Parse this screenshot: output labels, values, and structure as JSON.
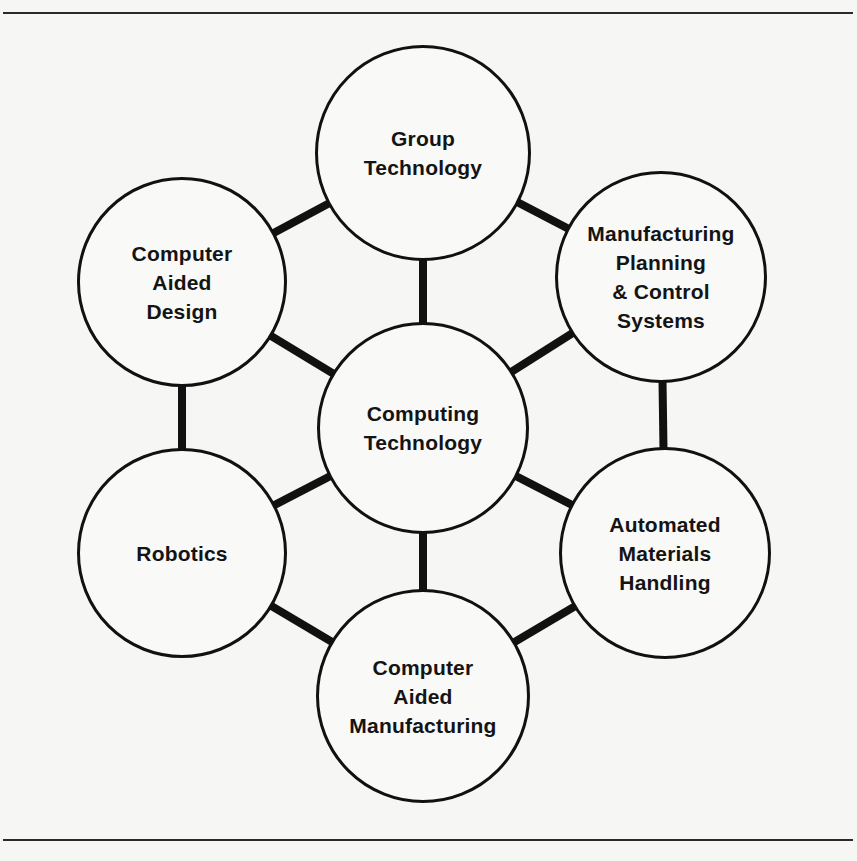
{
  "diagram": {
    "title": "",
    "colors": {
      "stroke": "#111111",
      "fill": "#f9f9f7",
      "background": "#f6f6f4",
      "text": "#141414"
    },
    "rules": [
      {
        "y": 12
      },
      {
        "y": 839
      }
    ],
    "nodes": [
      {
        "id": "group-technology",
        "label": "Group\nTechnology",
        "cx": 423,
        "cy": 153,
        "r": 108
      },
      {
        "id": "computer-aided-design",
        "label": "Computer\nAided\nDesign",
        "cx": 182,
        "cy": 282,
        "r": 105
      },
      {
        "id": "manufacturing-planning-control-systems",
        "label": "Manufacturing\nPlanning\n& Control\nSystems",
        "cx": 661,
        "cy": 277,
        "r": 106
      },
      {
        "id": "computing-technology",
        "label": "Computing\nTechnology",
        "cx": 423,
        "cy": 428,
        "r": 106
      },
      {
        "id": "robotics",
        "label": "Robotics",
        "cx": 182,
        "cy": 553,
        "r": 105
      },
      {
        "id": "automated-materials-handling",
        "label": "Automated\nMaterials\nHandling",
        "cx": 665,
        "cy": 553,
        "r": 106
      },
      {
        "id": "computer-aided-manufacturing",
        "label": "Computer\nAided\nManufacturing",
        "cx": 423,
        "cy": 696,
        "r": 107
      }
    ],
    "edges": [
      {
        "from": "group-technology",
        "to": "computer-aided-design"
      },
      {
        "from": "group-technology",
        "to": "manufacturing-planning-control-systems"
      },
      {
        "from": "manufacturing-planning-control-systems",
        "to": "automated-materials-handling"
      },
      {
        "from": "automated-materials-handling",
        "to": "computer-aided-manufacturing"
      },
      {
        "from": "computer-aided-manufacturing",
        "to": "robotics"
      },
      {
        "from": "robotics",
        "to": "computer-aided-design"
      },
      {
        "from": "computing-technology",
        "to": "group-technology"
      },
      {
        "from": "computing-technology",
        "to": "computer-aided-design"
      },
      {
        "from": "computing-technology",
        "to": "manufacturing-planning-control-systems"
      },
      {
        "from": "computing-technology",
        "to": "robotics"
      },
      {
        "from": "computing-technology",
        "to": "automated-materials-handling"
      },
      {
        "from": "computing-technology",
        "to": "computer-aided-manufacturing"
      }
    ]
  }
}
